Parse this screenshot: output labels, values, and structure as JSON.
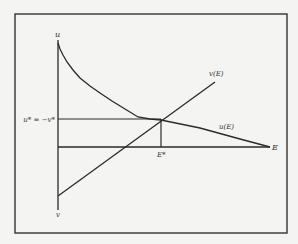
{
  "diagram": {
    "axis_u_label": "u",
    "axis_v_label": "v",
    "axis_e_label": "E",
    "equilibrium_label": "u* = −v*",
    "e_star_label": "E*",
    "curve_v_label": "v(E)",
    "curve_u_label": "u(E)"
  },
  "colors": {
    "background": "#f4f4f2",
    "line": "#2a2a2a",
    "frame": "#333333"
  }
}
